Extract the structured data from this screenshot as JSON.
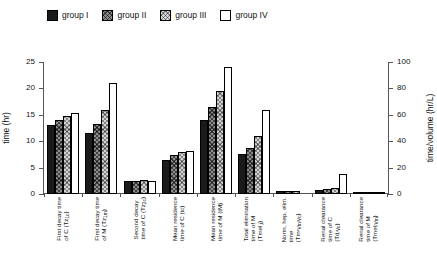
{
  "legend": {
    "items": [
      {
        "label": "group I",
        "key": "g1",
        "swatch": "solid-black-swatch"
      },
      {
        "label": "group II",
        "key": "g2",
        "swatch": "dark-hatch-swatch"
      },
      {
        "label": "group III",
        "key": "g3",
        "swatch": "light-hatch-swatch"
      },
      {
        "label": "group IV",
        "key": "g4",
        "swatch": "white-swatch"
      }
    ]
  },
  "axes": {
    "left": {
      "label": "time (hr)",
      "min": 0,
      "max": 25,
      "ticks": [
        0,
        5,
        10,
        15,
        20,
        25
      ]
    },
    "right": {
      "label": "time/volume (hr/L)",
      "min": 0,
      "max": 100,
      "ticks": [
        0,
        20,
        40,
        60,
        80,
        100
      ]
    }
  },
  "chart_data": {
    "type": "bar",
    "title": "",
    "xlabel": "",
    "ylabel": "time (hr)",
    "ylabel2": "time/volume (hr/L)",
    "ylim": [
      0,
      25
    ],
    "ylim2": [
      0,
      100
    ],
    "grid": false,
    "legend_position": "top-left",
    "categories": [
      "First decay time of C (Tz1c)",
      "First decay time of M (Tz1m)",
      "Second decay time of C (Tz2c)",
      "Mean residence time of C (tc)",
      "Mean residence time of M (tM)",
      "Total elimination time of M (Tmel,t)",
      "Norm. hep. elim. time (Tm*Vm/Vc)",
      "Renal clearance time of C (Td/Vc)",
      "Renal clearance time of M (Tmel/Vm)"
    ],
    "category_lines": [
      [
        "First decay time",
        "of C (Tz1c)"
      ],
      [
        "First decay time",
        "of M (Tz1m)"
      ],
      [
        "Second decay",
        "time of C (Tz2c)"
      ],
      [
        "Mean residence",
        "time of C (tc)"
      ],
      [
        "Mean residence",
        "time of M (tM)"
      ],
      [
        "Total elimination",
        "time of M",
        "(Tmel,t)"
      ],
      [
        "Norm. hep. elim.",
        "time",
        "(Tm*Vm/Vc)"
      ],
      [
        "Renal clearance",
        "time of C",
        "(Td/Vc)"
      ],
      [
        "Renal clearance",
        "time of M",
        "(Tmel/Vm)"
      ]
    ],
    "series": [
      {
        "name": "group I",
        "values": [
          13.0,
          11.5,
          2.5,
          6.5,
          14.0,
          7.5,
          2.6,
          3.0,
          0.3
        ]
      },
      {
        "name": "group II",
        "values": [
          14.0,
          13.3,
          2.5,
          7.4,
          16.5,
          8.8,
          2.4,
          3.6,
          0.5
        ]
      },
      {
        "name": "group III",
        "values": [
          14.7,
          16.0,
          2.6,
          8.0,
          19.5,
          11.0,
          2.1,
          4.6,
          0.8
        ]
      },
      {
        "name": "group IV",
        "values": [
          15.3,
          21.0,
          2.5,
          8.2,
          24.0,
          16.0,
          0.0,
          15.3,
          1.5
        ]
      }
    ],
    "axis_assignment": [
      "left",
      "left",
      "left",
      "left",
      "left",
      "left",
      "right",
      "right",
      "right"
    ]
  }
}
